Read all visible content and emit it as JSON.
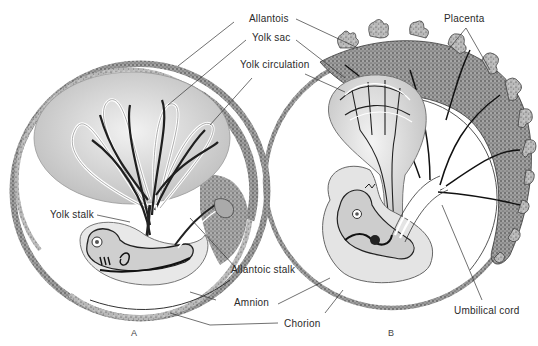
{
  "figure": {
    "panels": [
      {
        "id": "A",
        "letter": "A"
      },
      {
        "id": "B",
        "letter": "B"
      }
    ],
    "labels": {
      "allantois": "Allantois",
      "yolk_sac": "Yolk sac",
      "yolk_circulation": "Yolk circulation",
      "yolk_stalk": "Yolk stalk",
      "allantoic_stalk": "Allantoic stalk",
      "amnion": "Amnion",
      "chorion": "Chorion",
      "placenta": "Placenta",
      "umbilical_cord": "Umbilical cord"
    },
    "colors": {
      "ink": "#1a1a1a",
      "stipple": "#6b6b6b",
      "sac_fill": "#d9d9d9",
      "membrane_fill": "#eeeeee",
      "background": "#ffffff"
    }
  }
}
